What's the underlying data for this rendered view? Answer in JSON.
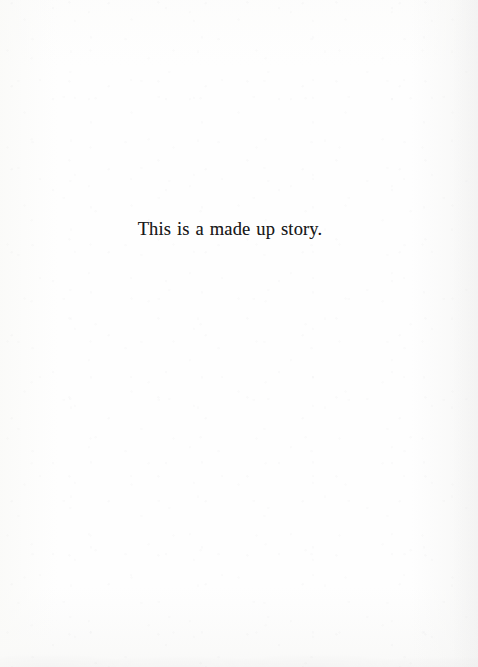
{
  "page": {
    "kind": "scanned-book-page",
    "paper_color": "#fdfdfd",
    "ink_color": "#191919",
    "width": 478,
    "height": 667
  },
  "content": {
    "epigraph": "This is a made up story."
  }
}
